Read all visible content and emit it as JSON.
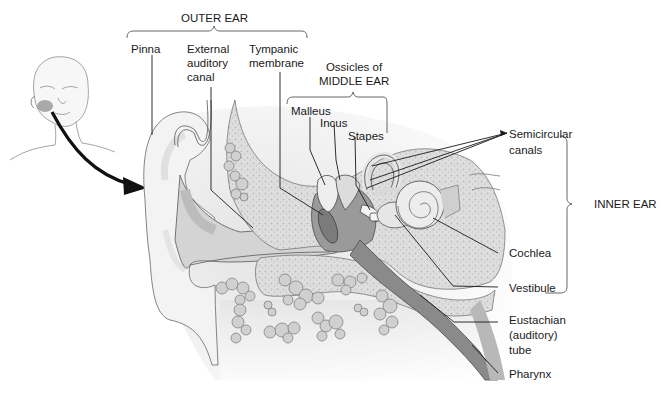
{
  "diagram": {
    "groups": {
      "outer_ear": "OUTER EAR",
      "middle_ear_line1": "Ossicles of",
      "middle_ear_line2": "MIDDLE EAR",
      "inner_ear": "INNER EAR"
    },
    "labels": {
      "pinna": "Pinna",
      "external_canal_1": "External",
      "external_canal_2": "auditory",
      "external_canal_3": "canal",
      "tympanic_1": "Tympanic",
      "tympanic_2": "membrane",
      "malleus": "Malleus",
      "incus": "Incus",
      "stapes": "Stapes",
      "semicircular_1": "Semicircular",
      "semicircular_2": "canals",
      "cochlea": "Cochlea",
      "vestibule": "Vestibule",
      "eustachian_1": "Eustachian",
      "eustachian_2": "(auditory)",
      "eustachian_3": "tube",
      "pharynx": "Pharynx"
    },
    "colors": {
      "line": "#1a1a1a",
      "skin": "#f1f1f1",
      "bone": "#d9d9d9",
      "dark_tissue": "#8a8a8a",
      "mid_tissue": "#b5b5b5"
    }
  }
}
